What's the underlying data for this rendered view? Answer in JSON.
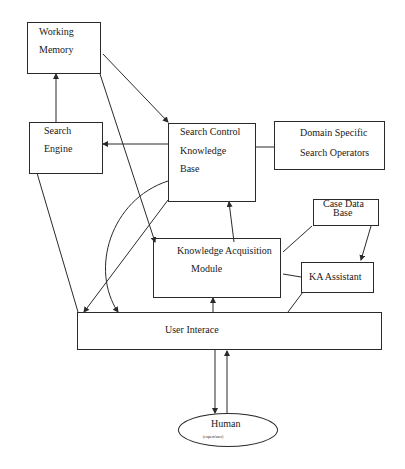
{
  "diagram": {
    "nodes": {
      "working_memory": {
        "line1": "Working",
        "line2": "Memory"
      },
      "search_engine": {
        "line1": "Search",
        "line2": "Engine"
      },
      "search_control_kb": {
        "line1": "Search Control",
        "line2": "Knowledge",
        "line3": "Base"
      },
      "domain_specific": {
        "line1": "Domain Specific",
        "line2": "Search Operators"
      },
      "case_data_base": {
        "line1": "Case Data",
        "line2": "Base"
      },
      "ka_module": {
        "line1": "Knowledge Acquisition",
        "line2": "Module"
      },
      "ka_assistant": {
        "label": "KA Assistant"
      },
      "user_interface": {
        "label": "User Interace"
      },
      "human": {
        "label": "Human",
        "sublabel": "(expert/user)"
      }
    },
    "edges": [
      {
        "from": "Search Engine",
        "to": "Working Memory"
      },
      {
        "from": "Working Memory",
        "to": "Search Control Knowledge Base"
      },
      {
        "from": "Working Memory",
        "to": "Knowledge Acquisition Module"
      },
      {
        "from": "Search Control Knowledge Base",
        "to": "Search Engine"
      },
      {
        "from": "Search Control Knowledge Base",
        "to": "Domain Specific Search Operators"
      },
      {
        "from": "Knowledge Acquisition Module",
        "to": "Search Control Knowledge Base"
      },
      {
        "from": "Search Control Knowledge Base",
        "to": "User Interace"
      },
      {
        "from": "User Interace",
        "to": "Search Control Knowledge Base"
      },
      {
        "from": "Search Engine",
        "to": "User Interace"
      },
      {
        "from": "Case Data Base",
        "to": "Knowledge Acquisition Module"
      },
      {
        "from": "Case Data Base",
        "to": "KA Assistant"
      },
      {
        "from": "KA Assistant",
        "to": "Knowledge Acquisition Module"
      },
      {
        "from": "KA Assistant",
        "to": "User Interace"
      },
      {
        "from": "User Interace",
        "to": "Knowledge Acquisition Module"
      },
      {
        "from": "User Interace",
        "to": "Human"
      },
      {
        "from": "Human",
        "to": "User Interace"
      }
    ]
  }
}
